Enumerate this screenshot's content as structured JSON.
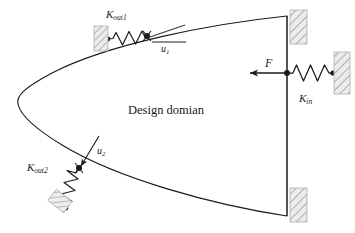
{
  "figure": {
    "background_color": "#ffffff",
    "line_color": "#1a1a1a",
    "hatch_color": "#9a9a9a",
    "hatch_fill": "#e8e8e8"
  },
  "labels": {
    "domain": "Design domian",
    "k_out1": "K",
    "k_out1_sub": "out1",
    "k_out2": "K",
    "k_out2_sub": "out2",
    "k_in": "K",
    "k_in_sub": "in",
    "u1": "u",
    "u1_sub": "1",
    "u2": "u",
    "u2_sub": "2",
    "force": "F"
  },
  "elements": {
    "design_domain_name": "parabolic-design-domain",
    "beam_name": "right-vertical-beam",
    "force_arrow_name": "input-force-arrow",
    "input_spring_name": "input-spring",
    "output_spring_1_name": "output-spring-1",
    "output_spring_2_name": "output-spring-2",
    "support_top_name": "fixed-support-top-right",
    "support_bottom_name": "fixed-support-bottom-right",
    "support_input_name": "fixed-support-input-spring",
    "support_out1_name": "fixed-support-output-spring-1",
    "support_out2_name": "fixed-support-output-spring-2",
    "node_input_name": "input-node",
    "node_out1_name": "output-node-1",
    "node_out2_name": "output-node-2"
  },
  "geometry": {
    "domain_top_point": [
      287,
      16
    ],
    "domain_bottom_point": [
      287,
      216
    ],
    "domain_vertex": [
      18,
      101
    ],
    "input_node": [
      287,
      73
    ],
    "force_arrow_tip": [
      245,
      73
    ],
    "output_node_1": [
      147,
      36
    ],
    "output_node_2": [
      79,
      168
    ]
  }
}
